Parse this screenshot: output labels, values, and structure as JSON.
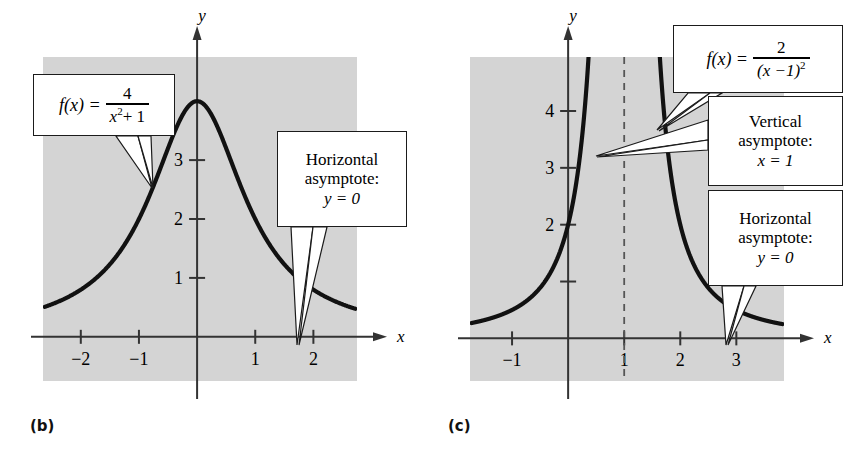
{
  "figure": {
    "background": "#ffffff",
    "plot_fill": "#d4d4d4",
    "axis_color": "#333333",
    "curve_color": "#111111"
  },
  "panels": [
    {
      "id": "b",
      "label": "(b)",
      "function_latex": "f(x) = 4/(x^2 + 1)",
      "formula": {
        "lhs": "f(x) =",
        "numerator": "4",
        "denominator_base": "x",
        "denominator_exp": "2",
        "denominator_rest": "+ 1"
      },
      "axes": {
        "x_label": "x",
        "y_label": "y",
        "x_ticks": [
          "-2",
          "-1",
          "1",
          "2"
        ],
        "x_tick_values": [
          -2,
          -1,
          1,
          2
        ],
        "y_ticks": [
          "1",
          "2",
          "3"
        ],
        "y_tick_values": [
          1,
          2,
          3
        ],
        "xlim": [
          -2.65,
          2.75
        ],
        "ylim": [
          -0.75,
          4.75
        ]
      },
      "callouts": [
        {
          "name": "horizontal-asymptote",
          "lines": [
            "Horizontal",
            "asymptote:",
            "y = 0"
          ]
        }
      ]
    },
    {
      "id": "c",
      "label": "(c)",
      "function_latex": "f(x) = 2/(x-1)^2",
      "formula": {
        "lhs": "f(x) =",
        "numerator": "2",
        "denominator_base": "(x −1)",
        "denominator_exp": "2"
      },
      "axes": {
        "x_label": "x",
        "y_label": "y",
        "x_ticks": [
          "-1",
          "1",
          "2",
          "3"
        ],
        "x_tick_values": [
          -1,
          1,
          2,
          3
        ],
        "y_ticks": [
          "2",
          "3",
          "4"
        ],
        "y_tick_values": [
          2,
          3,
          4
        ],
        "y_unlabeled_ticks": [
          1
        ],
        "xlim": [
          -1.75,
          3.85
        ],
        "ylim": [
          -0.75,
          4.95
        ]
      },
      "vertical_asymptote": {
        "x": 1,
        "style": "dashed"
      },
      "callouts": [
        {
          "name": "vertical-asymptote",
          "lines": [
            "Vertical",
            "asymptote:",
            "x = 1"
          ]
        },
        {
          "name": "horizontal-asymptote",
          "lines": [
            "Horizontal",
            "asymptote:",
            "y = 0"
          ]
        }
      ]
    }
  ],
  "chart_data": [
    {
      "type": "line",
      "panel": "(b)",
      "title": "",
      "expression": "f(x) = 4 / (x^2 + 1)",
      "xlabel": "x",
      "ylabel": "y",
      "xlim": [
        -2.65,
        2.75
      ],
      "ylim": [
        -0.75,
        4.75
      ],
      "xticks": [
        -2,
        -1,
        1,
        2
      ],
      "yticks": [
        1,
        2,
        3
      ],
      "grid": false,
      "annotations": [
        "f(x) = 4/(x²+1)",
        "Horizontal asymptote: y = 0"
      ],
      "asymptotes": {
        "horizontal": [
          0
        ],
        "vertical": []
      },
      "x": [
        -2.6,
        -2.4,
        -2.2,
        -2.0,
        -1.8,
        -1.6,
        -1.4,
        -1.2,
        -1.0,
        -0.8,
        -0.6,
        -0.4,
        -0.2,
        0.0,
        0.2,
        0.4,
        0.6,
        0.8,
        1.0,
        1.2,
        1.4,
        1.6,
        1.8,
        2.0,
        2.2,
        2.4,
        2.6
      ],
      "y": [
        0.52,
        0.6,
        0.68,
        0.8,
        0.94,
        1.12,
        1.35,
        1.64,
        2.0,
        2.44,
        2.94,
        3.45,
        3.85,
        4.0,
        3.85,
        3.45,
        2.94,
        2.44,
        2.0,
        1.64,
        1.35,
        1.12,
        0.94,
        0.8,
        0.68,
        0.6,
        0.52
      ]
    },
    {
      "type": "line",
      "panel": "(c)",
      "title": "",
      "expression": "f(x) = 2 / (x - 1)^2",
      "xlabel": "x",
      "ylabel": "y",
      "xlim": [
        -1.75,
        3.85
      ],
      "ylim": [
        -0.75,
        4.95
      ],
      "xticks": [
        -1,
        1,
        2,
        3
      ],
      "yticks": [
        2,
        3,
        4
      ],
      "grid": false,
      "annotations": [
        "f(x) = 2/(x−1)²",
        "Vertical asymptote: x = 1",
        "Horizontal asymptote: y = 0"
      ],
      "asymptotes": {
        "horizontal": [
          0
        ],
        "vertical": [
          1
        ]
      },
      "branches": [
        {
          "name": "left-branch",
          "x": [
            -1.7,
            -1.4,
            -1.1,
            -0.8,
            -0.5,
            -0.2,
            0.0,
            0.1,
            0.2,
            0.3,
            0.35,
            0.37
          ],
          "y": [
            0.27,
            0.35,
            0.45,
            0.62,
            0.89,
            1.39,
            2.0,
            2.47,
            3.13,
            4.08,
            4.73,
            5.04
          ]
        },
        {
          "name": "right-branch",
          "x": [
            1.63,
            1.65,
            1.7,
            1.8,
            1.9,
            2.0,
            2.2,
            2.4,
            2.6,
            2.8,
            3.0,
            3.3,
            3.6,
            3.8
          ],
          "y": [
            5.04,
            4.73,
            4.08,
            3.13,
            2.47,
            2.0,
            1.39,
            1.02,
            0.78,
            0.62,
            0.5,
            0.37,
            0.29,
            0.24
          ]
        }
      ]
    }
  ]
}
